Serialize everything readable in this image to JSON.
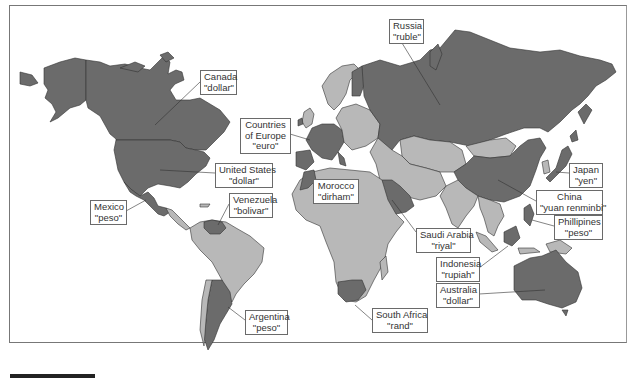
{
  "figure": {
    "colors": {
      "highlighted_country": "#6b6b6b",
      "other_country": "#b8b8b8",
      "ocean": "#ffffff",
      "border": "#333333"
    }
  },
  "labels": [
    {
      "id": "canada",
      "country": "Canada",
      "currency": "\"dollar\""
    },
    {
      "id": "europe",
      "country_line1": "Countries",
      "country_line2": "of Europe",
      "currency": "\"euro\""
    },
    {
      "id": "united_states",
      "country": "United States",
      "currency": "\"dollar\""
    },
    {
      "id": "mexico",
      "country": "Mexico",
      "currency": "\"peso\""
    },
    {
      "id": "venezuela",
      "country": "Venezuela",
      "currency": "\"bolivar\""
    },
    {
      "id": "argentina",
      "country": "Argentina",
      "currency": "\"peso\""
    },
    {
      "id": "russia",
      "country": "Russia",
      "currency": "\"ruble\""
    },
    {
      "id": "morocco",
      "country": "Morocco",
      "currency": "\"dirham\""
    },
    {
      "id": "saudi_arabia",
      "country": "Saudi Arabia",
      "currency": "\"riyal\""
    },
    {
      "id": "south_africa",
      "country": "South Africa",
      "currency": "\"rand\""
    },
    {
      "id": "japan",
      "country": "Japan",
      "currency": "\"yen\""
    },
    {
      "id": "china",
      "country": "China",
      "currency": "\"yuan renminbi\""
    },
    {
      "id": "phillipines",
      "country": "Phillipines",
      "currency": "\"peso\""
    },
    {
      "id": "indonesia",
      "country": "Indonesia",
      "currency": "\"rupiah\""
    },
    {
      "id": "australia",
      "country": "Australia",
      "currency": "\"dollar\""
    }
  ]
}
